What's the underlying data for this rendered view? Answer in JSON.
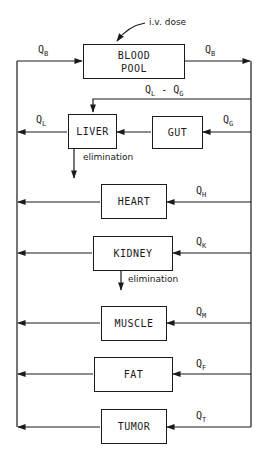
{
  "diagram": {
    "type": "physiologically-based pharmacokinetic model",
    "input": "i.v. dose",
    "compartments": [
      {
        "id": "blood",
        "label": "BLOOD\nPOOL",
        "line1": "BLOOD",
        "line2": "POOL"
      },
      {
        "id": "liver",
        "label": "LIVER"
      },
      {
        "id": "gut",
        "label": "GUT"
      },
      {
        "id": "heart",
        "label": "HEART"
      },
      {
        "id": "kidney",
        "label": "KIDNEY"
      },
      {
        "id": "muscle",
        "label": "MUSCLE"
      },
      {
        "id": "fat",
        "label": "FAT"
      },
      {
        "id": "tumor",
        "label": "TUMOR"
      }
    ],
    "flows": {
      "blood_in": {
        "q": "Q",
        "sub": "B"
      },
      "blood_out": {
        "q": "Q",
        "sub": "B"
      },
      "liver_arterial": {
        "q": "Q",
        "sub1": "L",
        "mid": " - Q",
        "sub2": "G"
      },
      "liver_out": {
        "q": "Q",
        "sub": "L"
      },
      "gut": {
        "q": "Q",
        "sub": "G"
      },
      "heart": {
        "q": "Q",
        "sub": "H"
      },
      "kidney": {
        "q": "Q",
        "sub": "K"
      },
      "muscle": {
        "q": "Q",
        "sub": "M"
      },
      "fat": {
        "q": "Q",
        "sub": "F"
      },
      "tumor": {
        "q": "Q",
        "sub": "T"
      }
    },
    "elimination_label": "elimination",
    "elimination_sites": [
      "liver",
      "kidney"
    ]
  }
}
